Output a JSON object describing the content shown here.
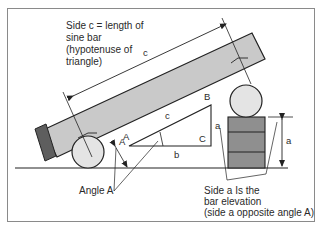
{
  "labels": {
    "side_c_note": [
      "Side c = length of",
      "sine bar",
      "(hypotenuse of",
      "triangle)"
    ],
    "dim_c": "c",
    "triangle": {
      "A": "A",
      "B": "B",
      "C": "C",
      "a": "a",
      "b": "b",
      "c": "c"
    },
    "angle_a_marker": "A",
    "dim_a": "a",
    "angle_a_note": "Angle A",
    "side_a_note": [
      "Side a Is the",
      "bar elevation",
      "(side a opposite angle A)"
    ]
  },
  "colors": {
    "background": "#ffffff",
    "frame": "#8a8a8a",
    "line": "#222222",
    "bar_fill": "#c9c9c9",
    "roller_fill": "#e4e4e4",
    "gauge_block_fill": "#8f8f8f",
    "end_plate_fill": "#5e5e5e"
  }
}
